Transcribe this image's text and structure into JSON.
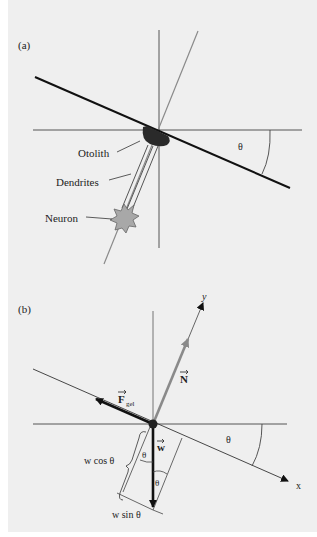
{
  "panel_a": {
    "label": "(a)",
    "labels": {
      "otolith": "Otolith",
      "dendrites": "Dendrites",
      "neuron": "Neuron",
      "angle": "θ"
    }
  },
  "panel_b": {
    "label": "(b)",
    "labels": {
      "y_axis": "y",
      "x_axis": "x",
      "normal_force": "N",
      "gel_force": "F",
      "gel_force_sub": "gel",
      "weight": "w",
      "w_cos": "w cos θ",
      "w_sin": "w sin θ",
      "angle_incline": "θ",
      "angle_w1": "θ",
      "angle_w2": "θ"
    }
  },
  "colors": {
    "background": "#efefef",
    "line": "#333333",
    "gray_vector": "#8a8a8a",
    "otolith": "#2a2a2a",
    "neuron": "#a8a8a8"
  }
}
